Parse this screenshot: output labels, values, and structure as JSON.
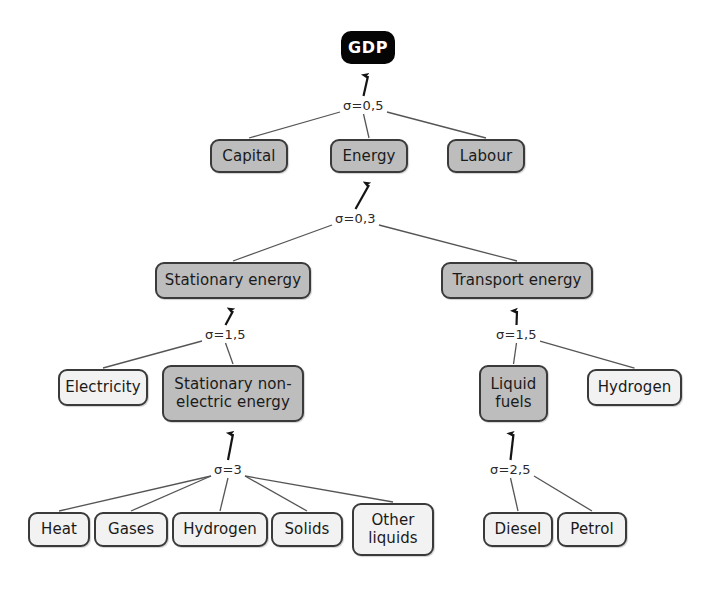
{
  "diagram": {
    "colors": {
      "root_fill": "#050505",
      "root_text": "#ffffff",
      "grey_fill": "#bdbdbd",
      "light_fill": "#f2f2f2",
      "border": "#3a3a3a",
      "edge": "#404040",
      "background": "#ffffff"
    },
    "nodes": [
      {
        "id": "gdp",
        "label": "GDP",
        "style": "root",
        "x": 341,
        "y": 31,
        "w": 54,
        "h": 33
      },
      {
        "id": "capital",
        "label": "Capital",
        "style": "grey",
        "x": 210,
        "y": 139,
        "w": 78,
        "h": 34
      },
      {
        "id": "energy",
        "label": "Energy",
        "style": "grey",
        "x": 330,
        "y": 139,
        "w": 78,
        "h": 34
      },
      {
        "id": "labour",
        "label": "Labour",
        "style": "grey",
        "x": 447,
        "y": 139,
        "w": 78,
        "h": 34
      },
      {
        "id": "stationary",
        "label": "Stationary energy",
        "style": "grey",
        "x": 155,
        "y": 262,
        "w": 156,
        "h": 37
      },
      {
        "id": "transport",
        "label": "Transport energy",
        "style": "grey",
        "x": 441,
        "y": 262,
        "w": 152,
        "h": 37
      },
      {
        "id": "electricity",
        "label": "Electricity",
        "style": "light",
        "x": 58,
        "y": 369,
        "w": 90,
        "h": 37
      },
      {
        "id": "statnonelec",
        "label": "Stationary non-electric energy",
        "style": "grey",
        "x": 162,
        "y": 365,
        "w": 142,
        "h": 57
      },
      {
        "id": "liquidfuels",
        "label": "Liquid fuels",
        "style": "grey",
        "x": 479,
        "y": 365,
        "w": 69,
        "h": 57
      },
      {
        "id": "hydrogen_t",
        "label": "Hydrogen",
        "style": "light",
        "x": 587,
        "y": 369,
        "w": 95,
        "h": 37
      },
      {
        "id": "heat",
        "label": "Heat",
        "style": "light",
        "x": 28,
        "y": 512,
        "w": 62,
        "h": 35
      },
      {
        "id": "gases",
        "label": "Gases",
        "style": "light",
        "x": 94,
        "y": 512,
        "w": 74,
        "h": 35
      },
      {
        "id": "hydrogen_s",
        "label": "Hydrogen",
        "style": "light",
        "x": 172,
        "y": 512,
        "w": 96,
        "h": 35
      },
      {
        "id": "solids",
        "label": "Solids",
        "style": "light",
        "x": 271,
        "y": 512,
        "w": 72,
        "h": 35
      },
      {
        "id": "otherliq",
        "label": "Other liquids",
        "style": "light",
        "x": 352,
        "y": 503,
        "w": 82,
        "h": 53
      },
      {
        "id": "diesel",
        "label": "Diesel",
        "style": "light",
        "x": 483,
        "y": 512,
        "w": 70,
        "h": 35
      },
      {
        "id": "petrol",
        "label": "Petrol",
        "style": "light",
        "x": 557,
        "y": 512,
        "w": 70,
        "h": 35
      }
    ],
    "sigma_labels": [
      {
        "id": "sigma_gdp",
        "text": "σ=0,5",
        "x": 341,
        "y": 98,
        "parent": "gdp"
      },
      {
        "id": "sigma_energy",
        "text": "σ=0,3",
        "x": 333,
        "y": 211,
        "parent": "energy"
      },
      {
        "id": "sigma_stationary",
        "text": "σ=1,5",
        "x": 203,
        "y": 327,
        "parent": "stationary"
      },
      {
        "id": "sigma_transport",
        "text": "σ=1,5",
        "x": 494,
        "y": 327,
        "parent": "transport"
      },
      {
        "id": "sigma_statnonelec",
        "text": "σ=3",
        "x": 212,
        "y": 462,
        "parent": "statnonelec"
      },
      {
        "id": "sigma_liquidfuels",
        "text": "σ=2,5",
        "x": 488,
        "y": 462,
        "parent": "liquidfuels"
      }
    ],
    "edges": [
      {
        "from": "sigma_gdp",
        "to": "gdp",
        "arrow": true
      },
      {
        "from": "capital",
        "to": "sigma_gdp",
        "arrow": false
      },
      {
        "from": "energy",
        "to": "sigma_gdp",
        "arrow": false
      },
      {
        "from": "labour",
        "to": "sigma_gdp",
        "arrow": false
      },
      {
        "from": "sigma_energy",
        "to": "energy",
        "arrow": true
      },
      {
        "from": "stationary",
        "to": "sigma_energy",
        "arrow": false
      },
      {
        "from": "transport",
        "to": "sigma_energy",
        "arrow": false
      },
      {
        "from": "sigma_stationary",
        "to": "stationary",
        "arrow": true
      },
      {
        "from": "electricity",
        "to": "sigma_stationary",
        "arrow": false
      },
      {
        "from": "statnonelec",
        "to": "sigma_stationary",
        "arrow": false
      },
      {
        "from": "sigma_transport",
        "to": "transport",
        "arrow": true
      },
      {
        "from": "liquidfuels",
        "to": "sigma_transport",
        "arrow": false
      },
      {
        "from": "hydrogen_t",
        "to": "sigma_transport",
        "arrow": false
      },
      {
        "from": "sigma_statnonelec",
        "to": "statnonelec",
        "arrow": true
      },
      {
        "from": "heat",
        "to": "sigma_statnonelec",
        "arrow": false
      },
      {
        "from": "gases",
        "to": "sigma_statnonelec",
        "arrow": false
      },
      {
        "from": "hydrogen_s",
        "to": "sigma_statnonelec",
        "arrow": false
      },
      {
        "from": "solids",
        "to": "sigma_statnonelec",
        "arrow": false
      },
      {
        "from": "otherliq",
        "to": "sigma_statnonelec",
        "arrow": false
      },
      {
        "from": "sigma_liquidfuels",
        "to": "liquidfuels",
        "arrow": true
      },
      {
        "from": "diesel",
        "to": "sigma_liquidfuels",
        "arrow": false
      },
      {
        "from": "petrol",
        "to": "sigma_liquidfuels",
        "arrow": false
      }
    ]
  }
}
